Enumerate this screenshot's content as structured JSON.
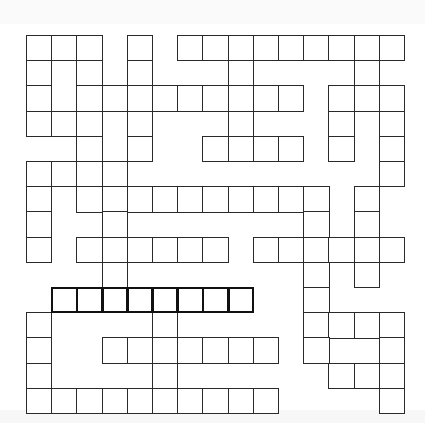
{
  "puzzle": {
    "type": "crossword",
    "cols": 15,
    "rows": 15,
    "origin": {
      "x": 26,
      "y": 35
    },
    "cell_size": 25.2,
    "colors": {
      "border": "#2a2a2a",
      "highlight_border": "#111111",
      "cell_fill": "#ffffff",
      "band": "#fafafa"
    },
    "grid_rows": [
      [
        0,
        1,
        2,
        4,
        6,
        7,
        8,
        9,
        10,
        11,
        12,
        13,
        14
      ],
      [
        0,
        2,
        4,
        8,
        13
      ],
      [
        0,
        2,
        3,
        4,
        5,
        6,
        7,
        8,
        9,
        10,
        12,
        13,
        14
      ],
      [
        0,
        1,
        2,
        4,
        8,
        12,
        14
      ],
      [
        2,
        4,
        7,
        8,
        9,
        10,
        12,
        14
      ],
      [
        0,
        1,
        2,
        3,
        14
      ],
      [
        0,
        2,
        3,
        4,
        5,
        6,
        7,
        8,
        9,
        10,
        11,
        13
      ],
      [
        0,
        3,
        11,
        13
      ],
      [
        0,
        2,
        3,
        4,
        5,
        6,
        7,
        9,
        10,
        11,
        12,
        13,
        14
      ],
      [
        3,
        11,
        13
      ],
      [
        1,
        2,
        3,
        4,
        5,
        6,
        7,
        8,
        11
      ],
      [
        0,
        5,
        11,
        12,
        13,
        14
      ],
      [
        0,
        3,
        4,
        5,
        6,
        7,
        8,
        9,
        11,
        14
      ],
      [
        0,
        5,
        12,
        13,
        14
      ],
      [
        0,
        1,
        2,
        3,
        4,
        5,
        6,
        7,
        8,
        9,
        14
      ]
    ],
    "highlighted_entry": {
      "row": 10,
      "col_start": 1,
      "col_end": 8,
      "direction": "across",
      "length": 8
    }
  }
}
